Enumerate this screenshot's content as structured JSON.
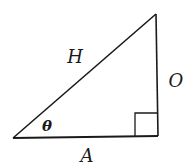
{
  "diagram": {
    "type": "right-triangle",
    "labels": {
      "hypotenuse": "H",
      "opposite": "O",
      "adjacent": "A",
      "angle": "θ"
    },
    "colors": {
      "stroke": "#1a1a1a",
      "background": "#ffffff"
    }
  }
}
